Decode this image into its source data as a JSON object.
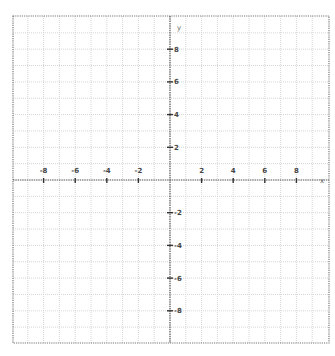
{
  "diagram": {
    "type": "coordinate-plane",
    "x_axis": {
      "name": "x",
      "min": -10,
      "max": 10,
      "grid_step": 1,
      "label_step": 2,
      "tick_labels": [
        "-8",
        "-6",
        "-4",
        "-2",
        "2",
        "4",
        "6",
        "8"
      ],
      "tick_values": [
        -8,
        -6,
        -4,
        -2,
        2,
        4,
        6,
        8
      ]
    },
    "y_axis": {
      "name": "y",
      "min": -10,
      "max": 10,
      "grid_step": 1,
      "label_step": 2,
      "tick_labels": [
        "8",
        "6",
        "4",
        "2",
        "-2",
        "-4",
        "-6",
        "-8"
      ],
      "tick_values": [
        8,
        6,
        4,
        2,
        -2,
        -4,
        -6,
        -8
      ]
    },
    "colors": {
      "grid": "#d6d6d6",
      "axis": "#555555",
      "border": "#777777",
      "label": "#444444"
    }
  }
}
